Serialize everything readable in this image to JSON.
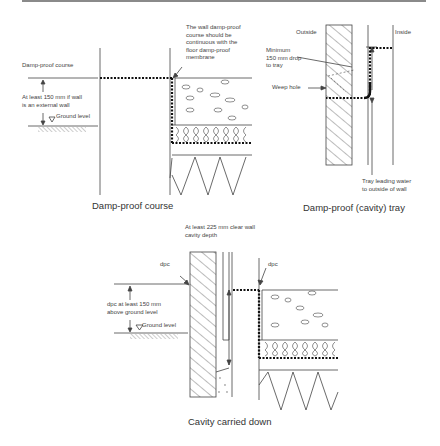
{
  "diagrams": [
    {
      "id": "dpc",
      "caption": "Damp-proof course",
      "labels": {
        "dpc": "Damp-proof course",
        "height_note": "At least 150 mm if wall\nis an external wall",
        "ground": "Ground level",
        "continuity_note": "The wall damp-proof\ncourse should be\ncontinuous with the\nfloor damp-proof\nmembrane"
      }
    },
    {
      "id": "tray",
      "caption": "Damp-proof (cavity) tray",
      "labels": {
        "outside": "Outside",
        "inside": "Inside",
        "min_drop": "Minimum\n150 mm drop\nto tray",
        "weep_hole": "Weep hole",
        "tray_note": "Tray leading water\nto outside of wall"
      }
    },
    {
      "id": "cavity",
      "caption": "Cavity carried down",
      "labels": {
        "cavity_depth": "At least 225 mm clear wall\ncavity depth",
        "dpc_left": "dpc",
        "dpc_right": "dpc",
        "height_note": "dpc at least 150 mm\nabove ground level",
        "ground": "Ground level"
      }
    }
  ]
}
